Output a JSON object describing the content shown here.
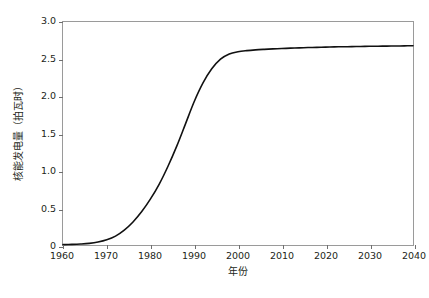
{
  "chart_data": {
    "type": "line",
    "title": "",
    "xlabel": "年份",
    "ylabel": "核能发电量（拍瓦时）",
    "xlim": [
      1960,
      2040
    ],
    "ylim": [
      0,
      3.0
    ],
    "grid": false,
    "legend": null,
    "line_color": "#111111",
    "frame_color": "#9a9a9a",
    "xticks": [
      "1960",
      "1970",
      "1980",
      "1990",
      "2000",
      "2010",
      "2020",
      "2030",
      "2040"
    ],
    "xtick_values": [
      1960,
      1970,
      1980,
      1990,
      2000,
      2010,
      2020,
      2030,
      2040
    ],
    "yticks": [
      "0",
      "0.5",
      "1.0",
      "1.5",
      "2.0",
      "2.5",
      "3.0"
    ],
    "ytick_values": [
      0,
      0.5,
      1.0,
      1.5,
      2.0,
      2.5,
      3.0
    ],
    "series": [
      {
        "name": "核能发电量",
        "x": [
          1960,
          1962,
          1964,
          1966,
          1968,
          1970,
          1972,
          1974,
          1976,
          1978,
          1980,
          1982,
          1984,
          1986,
          1988,
          1990,
          1992,
          1994,
          1996,
          1998,
          2000,
          2002,
          2004,
          2006,
          2008,
          2010,
          2012,
          2014,
          2016,
          2018,
          2020,
          2022,
          2024,
          2026,
          2028,
          2030,
          2032,
          2034,
          2036,
          2038,
          2040
        ],
        "values": [
          0.005,
          0.008,
          0.013,
          0.022,
          0.04,
          0.07,
          0.12,
          0.2,
          0.31,
          0.45,
          0.62,
          0.82,
          1.06,
          1.33,
          1.63,
          1.93,
          2.18,
          2.37,
          2.5,
          2.57,
          2.6,
          2.615,
          2.625,
          2.632,
          2.638,
          2.643,
          2.648,
          2.652,
          2.656,
          2.659,
          2.662,
          2.665,
          2.667,
          2.669,
          2.671,
          2.673,
          2.674,
          2.676,
          2.677,
          2.679,
          2.68
        ]
      }
    ]
  }
}
